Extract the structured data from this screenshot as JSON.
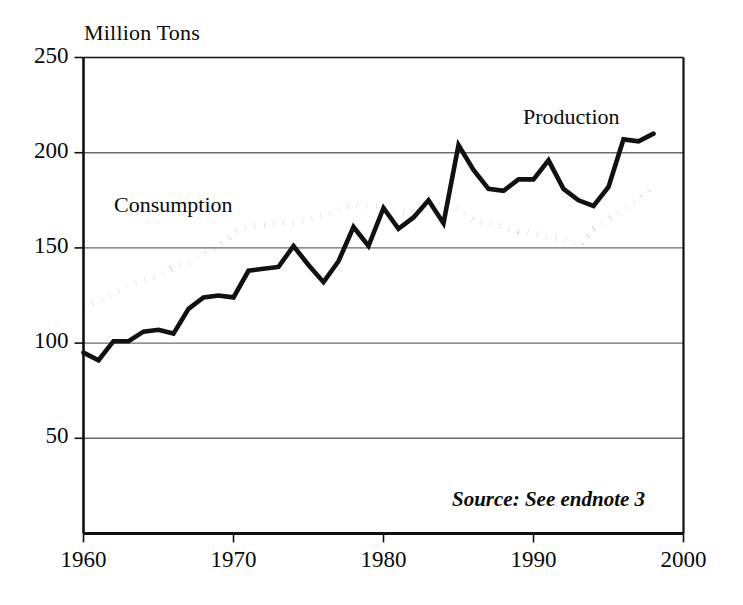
{
  "chart_data": {
    "type": "line",
    "title": "",
    "subtitle": "",
    "xlabel": "",
    "ylabel": "Million Tons",
    "xlim": [
      1960,
      2000
    ],
    "ylim": [
      0,
      250
    ],
    "xticks": [
      "1960",
      "1970",
      "1980",
      "1990",
      "2000"
    ],
    "yticks": [
      "50",
      "100",
      "150",
      "200",
      "250"
    ],
    "grid": true,
    "legend_position": "inline-annotations",
    "annotations": [
      "Consumption",
      "Production",
      "Source: See endnote 3"
    ],
    "source_note": "Source: See endnote 3",
    "x": [
      1960,
      1961,
      1962,
      1963,
      1964,
      1965,
      1966,
      1967,
      1968,
      1969,
      1970,
      1971,
      1972,
      1973,
      1974,
      1975,
      1976,
      1977,
      1978,
      1979,
      1980,
      1981,
      1982,
      1983,
      1984,
      1985,
      1986,
      1987,
      1988,
      1989,
      1990,
      1991,
      1992,
      1993,
      1994,
      1995,
      1996,
      1997,
      1998
    ],
    "series": [
      {
        "name": "Production",
        "style": "solid",
        "color": "#111111",
        "values": [
          95,
          91,
          101,
          101,
          106,
          107,
          105,
          118,
          124,
          125,
          124,
          138,
          139,
          140,
          151,
          141,
          132,
          143,
          161,
          151,
          171,
          160,
          166,
          175,
          163,
          204,
          191,
          181,
          180,
          186,
          186,
          196,
          181,
          175,
          172,
          182,
          207,
          206,
          210
        ]
      },
      {
        "name": "Consumption",
        "style": "dotted",
        "color": "#111111",
        "values": [
          119,
          122,
          126,
          130,
          133,
          135,
          140,
          142,
          147,
          150,
          158,
          161,
          162,
          163,
          163,
          165,
          167,
          170,
          173,
          172,
          172,
          168,
          168,
          172,
          174,
          171,
          164,
          163,
          161,
          159,
          158,
          155,
          155,
          151,
          160,
          165,
          170,
          175,
          183
        ]
      }
    ]
  },
  "axis": {
    "y_title": "Million Tons",
    "y_ticks": [
      {
        "value": 250,
        "label": "250"
      },
      {
        "value": 200,
        "label": "200"
      },
      {
        "value": 150,
        "label": "150"
      },
      {
        "value": 100,
        "label": "100"
      },
      {
        "value": 50,
        "label": "50"
      }
    ],
    "x_ticks": [
      {
        "value": 1960,
        "label": "1960"
      },
      {
        "value": 1970,
        "label": "1970"
      },
      {
        "value": 1980,
        "label": "1980"
      },
      {
        "value": 1990,
        "label": "1990"
      },
      {
        "value": 2000,
        "label": "2000"
      }
    ]
  },
  "labels": {
    "consumption": "Consumption",
    "production": "Production",
    "source": "Source: See endnote 3"
  },
  "colors": {
    "ink": "#111111",
    "grid": "#6b6b6b",
    "frame": "#111111",
    "background": "#ffffff"
  }
}
